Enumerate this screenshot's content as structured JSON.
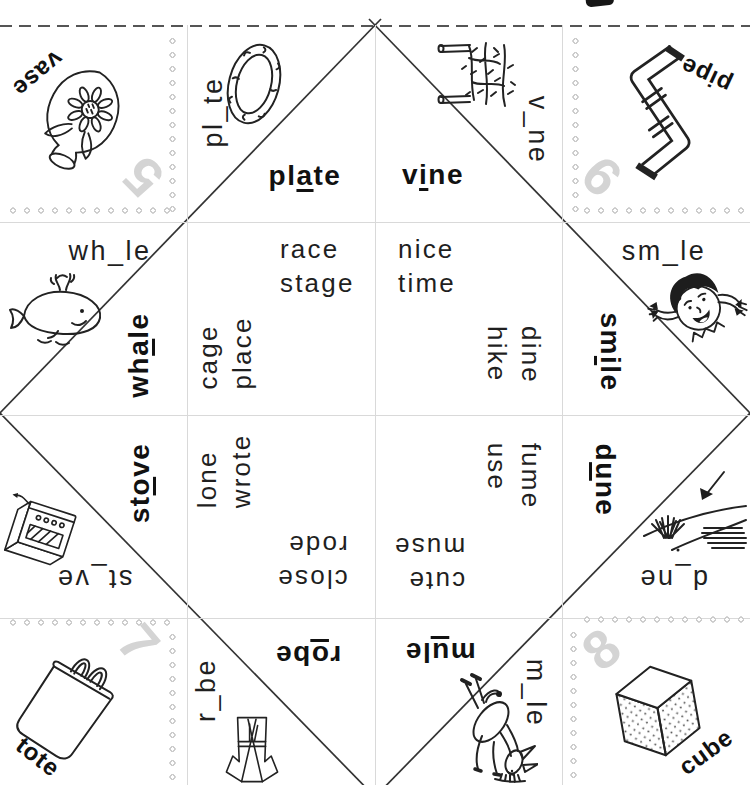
{
  "colors": {
    "ink": "#1f1f1f",
    "number_gray": "#d4d4d4",
    "perforation_gray": "#cccccc",
    "grid_gray": "#d9d9d9",
    "fold_line": "#333333"
  },
  "icons": {
    "scissors": "scissors-partial",
    "vase": "vase-with-sunflower",
    "plate": "oval-plate",
    "vine": "climbing-vine",
    "pipe": "metal-pipe",
    "whale": "cartoon-whale",
    "smile": "smiling-girl",
    "stove": "stove",
    "dune": "sand-dune-with-arrow",
    "tote": "tote-bag",
    "robe": "bathrobe",
    "mule": "kicking-mule",
    "cube": "dotted-cube"
  },
  "corners": {
    "vase": {
      "label": "vase",
      "number": "5"
    },
    "pipe": {
      "label": "pipe",
      "number": "6"
    },
    "tote": {
      "label": "tote",
      "number": "7"
    },
    "cube": {
      "label": "cube",
      "number": "8"
    }
  },
  "flaps": {
    "plate": {
      "blank": "pl_te",
      "pre": "pl",
      "vowel": "a",
      "post": "te"
    },
    "vine": {
      "blank": "v_ne",
      "pre": "v",
      "vowel": "i",
      "post": "ne"
    },
    "whale": {
      "blank": "wh_le",
      "pre": "wh",
      "vowel": "a",
      "post": "le"
    },
    "smile": {
      "blank": "sm_le",
      "pre": "sm",
      "vowel": "i",
      "post": "le"
    },
    "stove": {
      "blank": "st_ve",
      "pre": "st",
      "vowel": "o",
      "post": "ve"
    },
    "dune": {
      "blank": "d_ne",
      "pre": "d",
      "vowel": "u",
      "post": "ne"
    },
    "robe": {
      "blank": "r_be",
      "pre": "r",
      "vowel": "o",
      "post": "be"
    },
    "mule": {
      "blank": "m_le",
      "pre": "m",
      "vowel": "u",
      "post": "le"
    }
  },
  "word_lists": {
    "long_a": {
      "upright": [
        "race",
        "stage"
      ],
      "rotated": [
        "cage",
        "place"
      ]
    },
    "long_i": {
      "upright": [
        "nice",
        "time"
      ],
      "rotated": [
        "dine",
        "hike"
      ]
    },
    "long_o": {
      "rotated": [
        "lone",
        "wrote"
      ],
      "inverted": [
        "close",
        "rode"
      ]
    },
    "long_u": {
      "rotated": [
        "fume",
        "use"
      ],
      "inverted": [
        "cute",
        "muse"
      ]
    }
  }
}
